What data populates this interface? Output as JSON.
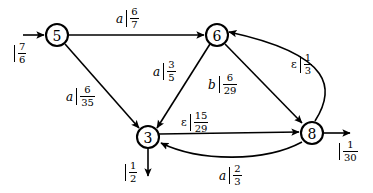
{
  "diagram": {
    "background": "#ffffff",
    "stroke": "#000000"
  },
  "nodes": [
    {
      "id": "5",
      "label": "5",
      "cx": 57,
      "cy": 35,
      "r": 11
    },
    {
      "id": "6",
      "label": "6",
      "cx": 217,
      "cy": 35,
      "r": 11
    },
    {
      "id": "3",
      "label": "3",
      "cx": 148,
      "cy": 137,
      "r": 11
    },
    {
      "id": "8",
      "label": "8",
      "cx": 312,
      "cy": 133,
      "r": 11
    }
  ],
  "edges": [
    {
      "id": "start-5",
      "from": "",
      "to": "5",
      "symbol": "",
      "num": "7",
      "den": "6",
      "kind": "initial"
    },
    {
      "id": "5-6",
      "from": "5",
      "to": "6",
      "symbol": "a",
      "num": "6",
      "den": "7",
      "kind": "straight"
    },
    {
      "id": "5-3",
      "from": "5",
      "to": "3",
      "symbol": "a",
      "num": "6",
      "den": "35",
      "kind": "straight"
    },
    {
      "id": "6-3",
      "from": "6",
      "to": "3",
      "symbol": "a",
      "num": "3",
      "den": "5",
      "kind": "straight"
    },
    {
      "id": "6-8",
      "from": "6",
      "to": "8",
      "symbol": "b",
      "num": "6",
      "den": "29",
      "kind": "straight"
    },
    {
      "id": "8-6",
      "from": "8",
      "to": "6",
      "symbol": "ε",
      "num": "1",
      "den": "3",
      "kind": "curved"
    },
    {
      "id": "3-8",
      "from": "3",
      "to": "8",
      "symbol": "ε",
      "num": "15",
      "den": "29",
      "kind": "straight"
    },
    {
      "id": "8-3",
      "from": "8",
      "to": "3",
      "symbol": "a",
      "num": "2",
      "den": "3",
      "kind": "curved"
    },
    {
      "id": "3-final",
      "from": "3",
      "to": "",
      "symbol": "",
      "num": "1",
      "den": "2",
      "kind": "final"
    },
    {
      "id": "8-final",
      "from": "8",
      "to": "",
      "symbol": "",
      "num": "1",
      "den": "30",
      "kind": "final"
    }
  ],
  "labels": {
    "start_5": {
      "symbol": "",
      "num": "7",
      "den": "6"
    },
    "e_5_6": {
      "symbol": "a",
      "num": "6",
      "den": "7"
    },
    "e_5_3": {
      "symbol": "a",
      "num": "6",
      "den": "35"
    },
    "e_6_3": {
      "symbol": "a",
      "num": "3",
      "den": "5"
    },
    "e_6_8": {
      "symbol": "b",
      "num": "6",
      "den": "29"
    },
    "e_8_6": {
      "symbol": "ε",
      "num": "1",
      "den": "3"
    },
    "e_3_8": {
      "symbol": "ε",
      "num": "15",
      "den": "29"
    },
    "e_8_3": {
      "symbol": "a",
      "num": "2",
      "den": "3"
    },
    "final_3": {
      "symbol": "",
      "num": "1",
      "den": "2"
    },
    "final_8": {
      "symbol": "",
      "num": "1",
      "den": "30"
    }
  }
}
